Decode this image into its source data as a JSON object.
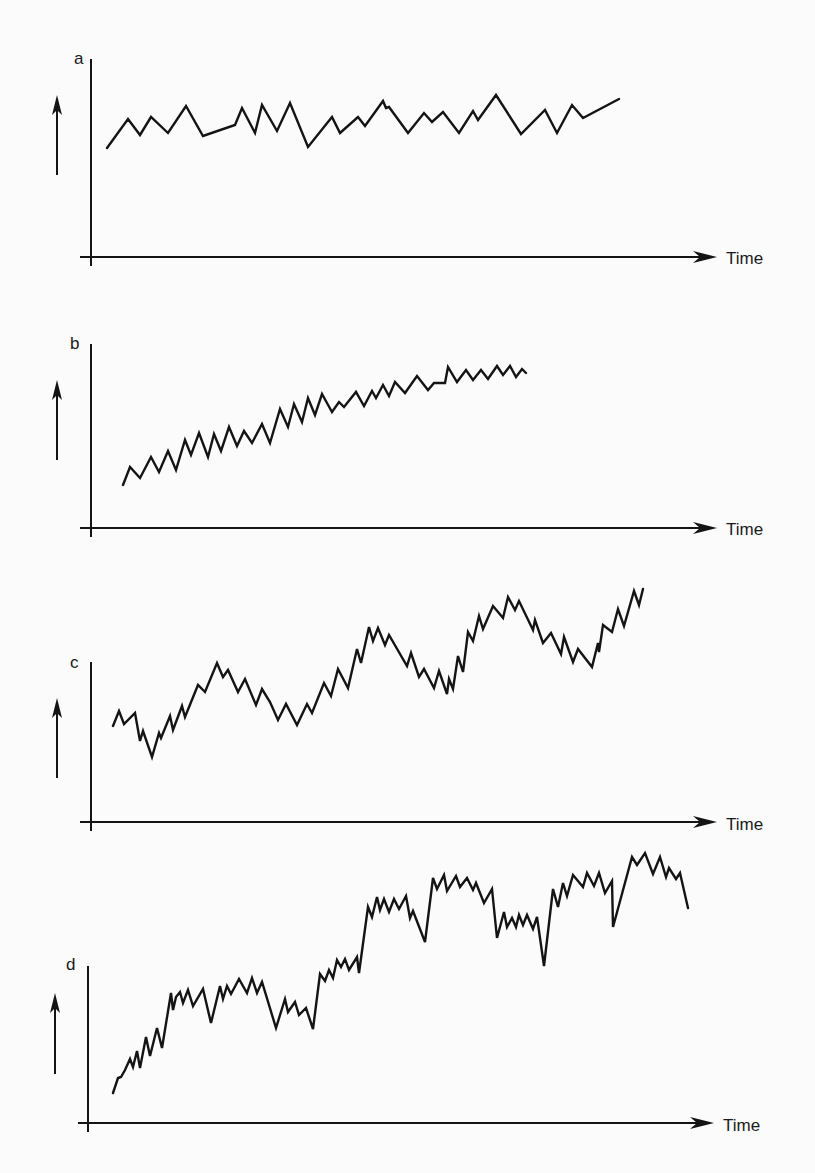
{
  "figure": {
    "width": 815,
    "height": 1173,
    "background": "#fbfbfb",
    "ink": "#141414"
  },
  "chart_data": [
    {
      "type": "line",
      "panel": "a",
      "title": "",
      "xlabel": "Time",
      "ylabel": "",
      "y_indicator": "up-arrow",
      "description": "Fluctuations around a constant level (no trend)",
      "grid": false,
      "legend": null,
      "frame": {
        "yaxis_x": 91,
        "yaxis_top": 59,
        "xaxis_y": 257,
        "xaxis_left": 80,
        "xaxis_right": 717
      },
      "label_pos": {
        "x": 74,
        "y": 64
      },
      "xlabel_pos": {
        "x": 726,
        "y": 264
      },
      "arrow": {
        "x": 57,
        "y1": 175,
        "y2": 95
      },
      "points": [
        [
          107,
          148
        ],
        [
          128,
          119
        ],
        [
          140,
          135
        ],
        [
          151,
          117
        ],
        [
          168,
          133
        ],
        [
          186,
          106
        ],
        [
          203,
          136
        ],
        [
          235,
          125
        ],
        [
          242,
          108
        ],
        [
          255,
          133
        ],
        [
          262,
          105
        ],
        [
          277,
          131
        ],
        [
          290,
          103
        ],
        [
          308,
          147
        ],
        [
          332,
          117
        ],
        [
          340,
          133
        ],
        [
          358,
          117
        ],
        [
          365,
          126
        ],
        [
          383,
          101
        ],
        [
          386,
          108
        ],
        [
          389,
          107
        ],
        [
          408,
          133
        ],
        [
          424,
          113
        ],
        [
          432,
          122
        ],
        [
          443,
          112
        ],
        [
          459,
          133
        ],
        [
          473,
          111
        ],
        [
          478,
          120
        ],
        [
          496,
          95
        ],
        [
          521,
          134
        ],
        [
          545,
          110
        ],
        [
          557,
          133
        ],
        [
          572,
          105
        ],
        [
          583,
          118
        ],
        [
          619,
          99
        ]
      ]
    },
    {
      "type": "line",
      "panel": "b",
      "title": "",
      "xlabel": "Time",
      "ylabel": "",
      "y_indicator": "up-arrow",
      "description": "Steady upward trend with regular small oscillations, flattening toward the end",
      "grid": false,
      "legend": null,
      "frame": {
        "yaxis_x": 91,
        "yaxis_top": 344,
        "xaxis_y": 528,
        "xaxis_left": 80,
        "xaxis_right": 717
      },
      "label_pos": {
        "x": 70,
        "y": 349
      },
      "xlabel_pos": {
        "x": 726,
        "y": 535
      },
      "arrow": {
        "x": 57,
        "y1": 460,
        "y2": 380
      },
      "points": [
        [
          123,
          485
        ],
        [
          130,
          467
        ],
        [
          140,
          478
        ],
        [
          151,
          457
        ],
        [
          159,
          472
        ],
        [
          168,
          451
        ],
        [
          176,
          470
        ],
        [
          185,
          440
        ],
        [
          191,
          455
        ],
        [
          199,
          433
        ],
        [
          208,
          457
        ],
        [
          214,
          434
        ],
        [
          221,
          451
        ],
        [
          229,
          427
        ],
        [
          237,
          446
        ],
        [
          244,
          431
        ],
        [
          252,
          443
        ],
        [
          262,
          424
        ],
        [
          270,
          443
        ],
        [
          280,
          409
        ],
        [
          288,
          427
        ],
        [
          294,
          404
        ],
        [
          302,
          422
        ],
        [
          308,
          398
        ],
        [
          315,
          415
        ],
        [
          322,
          394
        ],
        [
          332,
          412
        ],
        [
          339,
          402
        ],
        [
          344,
          407
        ],
        [
          356,
          392
        ],
        [
          364,
          406
        ],
        [
          372,
          391
        ],
        [
          376,
          398
        ],
        [
          383,
          385
        ],
        [
          389,
          396
        ],
        [
          395,
          382
        ],
        [
          405,
          393
        ],
        [
          417,
          376
        ],
        [
          428,
          390
        ],
        [
          434,
          383
        ],
        [
          445,
          383
        ],
        [
          448,
          367
        ],
        [
          457,
          382
        ],
        [
          466,
          370
        ],
        [
          473,
          380
        ],
        [
          481,
          370
        ],
        [
          488,
          379
        ],
        [
          497,
          366
        ],
        [
          503,
          375
        ],
        [
          510,
          366
        ],
        [
          516,
          377
        ],
        [
          522,
          369
        ],
        [
          526,
          373
        ]
      ]
    },
    {
      "type": "line",
      "panel": "c",
      "title": "",
      "xlabel": "Time",
      "ylabel": "",
      "y_indicator": "up-arrow",
      "description": "Upward trend with cyclical (wave-like) swings plus small oscillations",
      "grid": false,
      "legend": null,
      "frame": {
        "yaxis_x": 91,
        "yaxis_top": 662,
        "xaxis_y": 822,
        "xaxis_left": 80,
        "xaxis_right": 717
      },
      "label_pos": {
        "x": 70,
        "y": 668
      },
      "xlabel_pos": {
        "x": 726,
        "y": 830
      },
      "arrow": {
        "x": 57,
        "y1": 778,
        "y2": 698
      },
      "points": [
        [
          113,
          726
        ],
        [
          119,
          711
        ],
        [
          124,
          724
        ],
        [
          135,
          713
        ],
        [
          140,
          741
        ],
        [
          143,
          731
        ],
        [
          152,
          757
        ],
        [
          159,
          733
        ],
        [
          161,
          738
        ],
        [
          170,
          716
        ],
        [
          173,
          730
        ],
        [
          182,
          706
        ],
        [
          185,
          717
        ],
        [
          198,
          685
        ],
        [
          205,
          692
        ],
        [
          217,
          663
        ],
        [
          223,
          677
        ],
        [
          228,
          670
        ],
        [
          238,
          692
        ],
        [
          245,
          679
        ],
        [
          256,
          705
        ],
        [
          262,
          689
        ],
        [
          270,
          702
        ],
        [
          278,
          720
        ],
        [
          286,
          704
        ],
        [
          297,
          725
        ],
        [
          307,
          704
        ],
        [
          312,
          713
        ],
        [
          324,
          683
        ],
        [
          331,
          696
        ],
        [
          338,
          669
        ],
        [
          348,
          688
        ],
        [
          357,
          649
        ],
        [
          361,
          663
        ],
        [
          369,
          627
        ],
        [
          373,
          641
        ],
        [
          378,
          628
        ],
        [
          385,
          645
        ],
        [
          389,
          635
        ],
        [
          407,
          666
        ],
        [
          411,
          653
        ],
        [
          419,
          677
        ],
        [
          424,
          669
        ],
        [
          434,
          688
        ],
        [
          439,
          671
        ],
        [
          447,
          694
        ],
        [
          449,
          679
        ],
        [
          453,
          689
        ],
        [
          458,
          656
        ],
        [
          463,
          672
        ],
        [
          468,
          632
        ],
        [
          473,
          641
        ],
        [
          479,
          616
        ],
        [
          483,
          629
        ],
        [
          493,
          606
        ],
        [
          503,
          618
        ],
        [
          508,
          597
        ],
        [
          515,
          610
        ],
        [
          519,
          601
        ],
        [
          533,
          630
        ],
        [
          535,
          620
        ],
        [
          543,
          643
        ],
        [
          551,
          633
        ],
        [
          561,
          654
        ],
        [
          564,
          637
        ],
        [
          573,
          662
        ],
        [
          578,
          649
        ],
        [
          592,
          667
        ],
        [
          598,
          643
        ],
        [
          599,
          652
        ],
        [
          603,
          625
        ],
        [
          612,
          632
        ],
        [
          618,
          609
        ],
        [
          624,
          626
        ],
        [
          634,
          591
        ],
        [
          639,
          605
        ],
        [
          643,
          589
        ]
      ]
    },
    {
      "type": "line",
      "panel": "d",
      "title": "",
      "xlabel": "Time",
      "ylabel": "",
      "y_indicator": "up-arrow",
      "description": "Step-wise upward trend: sudden jumps followed by plateaus with oscillations and occasional sharp dips",
      "grid": false,
      "legend": null,
      "frame": {
        "yaxis_x": 88,
        "yaxis_top": 966,
        "xaxis_y": 1123,
        "xaxis_left": 78,
        "xaxis_right": 714
      },
      "label_pos": {
        "x": 66,
        "y": 970
      },
      "xlabel_pos": {
        "x": 723,
        "y": 1131
      },
      "arrow": {
        "x": 55,
        "y1": 1074,
        "y2": 993
      },
      "points": [
        [
          113,
          1093
        ],
        [
          118,
          1078
        ],
        [
          121,
          1077
        ],
        [
          125,
          1070
        ],
        [
          130,
          1059
        ],
        [
          133,
          1067
        ],
        [
          137,
          1051
        ],
        [
          140,
          1068
        ],
        [
          146,
          1037
        ],
        [
          150,
          1056
        ],
        [
          157,
          1028
        ],
        [
          162,
          1048
        ],
        [
          171,
          993
        ],
        [
          173,
          1010
        ],
        [
          176,
          997
        ],
        [
          180,
          992
        ],
        [
          183,
          1003
        ],
        [
          188,
          990
        ],
        [
          193,
          1006
        ],
        [
          203,
          989
        ],
        [
          211,
          1023
        ],
        [
          220,
          986
        ],
        [
          223,
          999
        ],
        [
          227,
          986
        ],
        [
          231,
          994
        ],
        [
          239,
          979
        ],
        [
          247,
          993
        ],
        [
          252,
          978
        ],
        [
          257,
          993
        ],
        [
          262,
          982
        ],
        [
          276,
          1028
        ],
        [
          285,
          999
        ],
        [
          288,
          1012
        ],
        [
          295,
          1002
        ],
        [
          299,
          1015
        ],
        [
          306,
          1008
        ],
        [
          313,
          1029
        ],
        [
          320,
          974
        ],
        [
          325,
          981
        ],
        [
          329,
          970
        ],
        [
          333,
          978
        ],
        [
          337,
          960
        ],
        [
          341,
          967
        ],
        [
          345,
          959
        ],
        [
          349,
          970
        ],
        [
          357,
          957
        ],
        [
          359,
          973
        ],
        [
          368,
          907
        ],
        [
          372,
          917
        ],
        [
          377,
          897
        ],
        [
          380,
          910
        ],
        [
          384,
          899
        ],
        [
          389,
          912
        ],
        [
          394,
          899
        ],
        [
          399,
          909
        ],
        [
          406,
          896
        ],
        [
          410,
          918
        ],
        [
          413,
          911
        ],
        [
          425,
          942
        ],
        [
          433,
          878
        ],
        [
          437,
          889
        ],
        [
          444,
          875
        ],
        [
          447,
          891
        ],
        [
          456,
          876
        ],
        [
          460,
          887
        ],
        [
          467,
          878
        ],
        [
          473,
          890
        ],
        [
          476,
          883
        ],
        [
          484,
          903
        ],
        [
          492,
          889
        ],
        [
          497,
          938
        ],
        [
          504,
          912
        ],
        [
          507,
          927
        ],
        [
          512,
          918
        ],
        [
          516,
          927
        ],
        [
          519,
          915
        ],
        [
          523,
          925
        ],
        [
          527,
          915
        ],
        [
          533,
          929
        ],
        [
          537,
          917
        ],
        [
          544,
          966
        ],
        [
          553,
          889
        ],
        [
          558,
          907
        ],
        [
          563,
          883
        ],
        [
          567,
          896
        ],
        [
          573,
          875
        ],
        [
          583,
          887
        ],
        [
          587,
          873
        ],
        [
          594,
          886
        ],
        [
          599,
          873
        ],
        [
          605,
          893
        ],
        [
          612,
          881
        ],
        [
          613,
          927
        ],
        [
          632,
          857
        ],
        [
          637,
          865
        ],
        [
          645,
          853
        ],
        [
          653,
          874
        ],
        [
          660,
          857
        ],
        [
          666,
          877
        ],
        [
          669,
          868
        ],
        [
          676,
          879
        ],
        [
          680,
          873
        ],
        [
          688,
          908
        ]
      ]
    }
  ],
  "panels": [
    {
      "label": "a",
      "xlabel": "Time"
    },
    {
      "label": "b",
      "xlabel": "Time"
    },
    {
      "label": "c",
      "xlabel": "Time"
    },
    {
      "label": "d",
      "xlabel": "Time"
    }
  ]
}
